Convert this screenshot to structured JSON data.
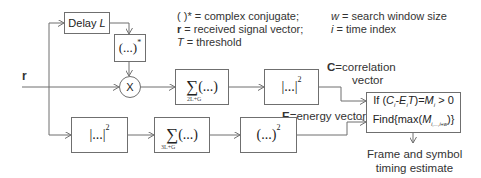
{
  "input_label": "r",
  "blocks": {
    "delay": {
      "label": "Delay",
      "var": "L"
    },
    "conjugate": {
      "label": "(...)",
      "sup": "*"
    },
    "multiplier": {
      "label": "X"
    },
    "sum_corr": {
      "sigma": "∑",
      "label": "(...)",
      "sub": "2L+G"
    },
    "abs_sq_corr": {
      "label": "|...|",
      "sup": "2"
    },
    "abs_sq_energy": {
      "label": "|...|",
      "sup": "2"
    },
    "sum_energy": {
      "sigma": "∑",
      "label": "(...)",
      "sub": "3L+G"
    },
    "square_energy": {
      "label": "(...)",
      "sup": "2"
    },
    "decision": {
      "line1_prefix": "If (",
      "line1_c": "C",
      "line1_ci": "i",
      "line1_minus": "-",
      "line1_e": "E",
      "line1_ei": "i",
      "line1_t": "T",
      "line1_eq": ")=",
      "line1_m": "M",
      "line1_mi": "i",
      "line1_suffix": " > 0",
      "line2_prefix": "Find{max(",
      "line2_m": "M",
      "line2_sub": "i,...,i+w",
      "line2_suffix": ")}"
    }
  },
  "signals": {
    "correlation": {
      "bold": "C",
      "label": "=correlation",
      "line2": "vector"
    },
    "energy": {
      "bold": "E",
      "label": "=energy vector"
    },
    "output": {
      "line1": "Frame and symbol",
      "line2": "timing estimate"
    }
  },
  "legend": {
    "conj": "( )* = complex conjugate;",
    "r_bold": "r",
    "r_text": " = received signal vector;",
    "t_it": "T",
    "t_text": " = threshold",
    "w_it": "w",
    "w_text": " = search window size",
    "i_it": "i",
    "i_text": " = time index"
  },
  "colors": {
    "line": "#6f6f6f",
    "text": "#333333"
  }
}
